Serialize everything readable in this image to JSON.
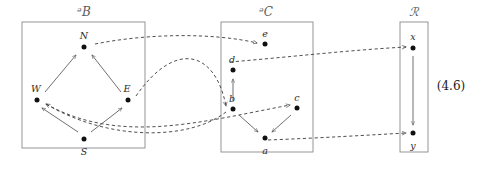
{
  "figure": {
    "equation_number": "(4.6)",
    "width": 488,
    "height": 171,
    "stroke_color": "#555555",
    "dashed_color": "#3b3b3b",
    "node_color": "#111111",
    "box_border_color": "#8a8a8a"
  },
  "boxes": [
    {
      "id": "P",
      "label": "ᵊB",
      "label_x": 84,
      "label_y": 12,
      "x": 22,
      "y": 22,
      "w": 123,
      "h": 126
    },
    {
      "id": "Q",
      "label": "ᵊC",
      "label_x": 266,
      "label_y": 12,
      "x": 221,
      "y": 22,
      "w": 92,
      "h": 130
    },
    {
      "id": "R",
      "label": "ℛ",
      "label_x": 414,
      "label_y": 12,
      "x": 400,
      "y": 22,
      "w": 28,
      "h": 130
    }
  ],
  "nodes": [
    {
      "id": "N",
      "label": "N",
      "box": "P",
      "cx": 84,
      "cy": 47,
      "lx": 84,
      "ly": 35
    },
    {
      "id": "W",
      "label": "W",
      "box": "P",
      "cx": 37,
      "cy": 100,
      "lx": 36,
      "ly": 88
    },
    {
      "id": "E",
      "label": "E",
      "box": "P",
      "cx": 128,
      "cy": 100,
      "lx": 127,
      "ly": 88
    },
    {
      "id": "S",
      "label": "S",
      "box": "P",
      "cx": 84,
      "cy": 139,
      "lx": 84,
      "ly": 151
    },
    {
      "id": "e",
      "label": "e",
      "box": "Q",
      "cx": 265,
      "cy": 44,
      "lx": 265,
      "ly": 33
    },
    {
      "id": "d",
      "label": "d",
      "box": "Q",
      "cx": 233,
      "cy": 70,
      "lx": 232,
      "ly": 59
    },
    {
      "id": "b",
      "label": "b",
      "box": "Q",
      "cx": 233,
      "cy": 109,
      "lx": 232,
      "ly": 98
    },
    {
      "id": "c",
      "label": "c",
      "box": "Q",
      "cx": 297,
      "cy": 108,
      "lx": 297,
      "ly": 97
    },
    {
      "id": "a",
      "label": "a",
      "box": "Q",
      "cx": 265,
      "cy": 138,
      "lx": 265,
      "ly": 150
    },
    {
      "id": "x",
      "label": "x",
      "box": "R",
      "cx": 413,
      "cy": 48,
      "lx": 413,
      "ly": 36
    },
    {
      "id": "y",
      "label": "y",
      "box": "R",
      "cx": 413,
      "cy": 133,
      "lx": 413,
      "ly": 145
    }
  ],
  "solid_edges": [
    {
      "id": "W-to-N",
      "from": "W",
      "to": "N",
      "x1": 45,
      "y1": 92,
      "x2": 76,
      "y2": 55
    },
    {
      "id": "E-to-N",
      "from": "E",
      "to": "N",
      "x1": 121,
      "y1": 92,
      "x2": 92,
      "y2": 55
    },
    {
      "id": "S-to-W",
      "from": "S",
      "to": "W",
      "x1": 78,
      "y1": 132,
      "x2": 42,
      "y2": 108
    },
    {
      "id": "S-to-E",
      "from": "S",
      "to": "E",
      "x1": 91,
      "y1": 132,
      "x2": 122,
      "y2": 108
    },
    {
      "id": "b-to-d",
      "from": "b",
      "to": "d",
      "x1": 233,
      "y1": 101,
      "x2": 233,
      "y2": 79
    },
    {
      "id": "b-to-a",
      "from": "b",
      "to": "a",
      "x1": 239,
      "y1": 115,
      "x2": 258,
      "y2": 132
    },
    {
      "id": "c-to-a",
      "from": "c",
      "to": "a",
      "x1": 291,
      "y1": 115,
      "x2": 272,
      "y2": 132
    },
    {
      "id": "x-to-y",
      "from": "x",
      "to": "y",
      "x1": 413,
      "y1": 56,
      "x2": 413,
      "y2": 125
    }
  ],
  "dashed_edges": [
    {
      "id": "N-to-e",
      "from": "N",
      "to": "e",
      "path": "M 95 44 C 150 33, 215 33, 257 43"
    },
    {
      "id": "E-to-b",
      "from": "E",
      "to": "b",
      "path": "M 136 96 C 175 40, 215 50, 226 106"
    },
    {
      "id": "S-to-W-arc",
      "from": "S",
      "to": "W",
      "path": "M 226 112 C 190 140, 110 142, 46 104"
    },
    {
      "id": "W-to-c",
      "from": "W",
      "to": "c",
      "path": "M 46 104 C 120 145, 200 122, 290 105"
    },
    {
      "id": "e-to-x",
      "from": "e",
      "to": "x",
      "path": "M 230 62 C 290 57, 350 50, 406 47"
    },
    {
      "id": "a-to-y",
      "from": "a",
      "to": "y",
      "path": "M 268 140 C 320 138, 370 135, 406 133"
    }
  ]
}
